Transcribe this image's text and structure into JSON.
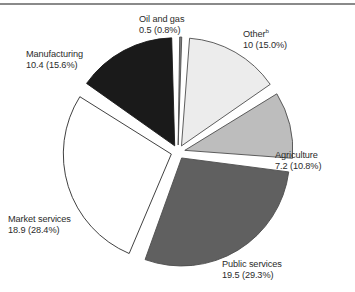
{
  "figure": {
    "name": "pie-chart-figure",
    "rule_color": "#8a8a8a",
    "background": "#ffffff",
    "text_color": "#2b2b2b"
  },
  "chart_data": {
    "type": "pie",
    "title": "",
    "subtitle": "",
    "xlabel": "",
    "ylabel": "",
    "legend_position": "none",
    "grid": false,
    "exploded": true,
    "total": 66.5,
    "units": "",
    "start_angle_deg": 0,
    "direction": "clockwise",
    "categories": [
      "Oil and gas",
      "Other",
      "Agriculture",
      "Public services",
      "Market services",
      "Manufacturing"
    ],
    "values": [
      0.5,
      10,
      7.2,
      19.5,
      18.9,
      10.4
    ],
    "percents": [
      0.8,
      15.0,
      10.8,
      29.3,
      28.4,
      15.6
    ],
    "colors": [
      "#808080",
      "#ececec",
      "#bdbdbd",
      "#606060",
      "#ffffff",
      "#1a1a1a"
    ],
    "slices": [
      {
        "key": "oil-and-gas",
        "name": "Oil and gas",
        "name_sup": "",
        "value": "0.5",
        "percent": "0.8%",
        "value_line": "0.5 (0.8%)",
        "color": "#808080",
        "stroke": "#4d4d4d"
      },
      {
        "key": "other",
        "name": "Other",
        "name_sup": "b",
        "value": "10",
        "percent": "15.0%",
        "value_line": "10 (15.0%)",
        "color": "#ececec",
        "stroke": "#4d4d4d"
      },
      {
        "key": "agriculture",
        "name": "Agriculture",
        "name_sup": "",
        "value": "7.2",
        "percent": "10.8%",
        "value_line": "7.2 (10.8%)",
        "color": "#bdbdbd",
        "stroke": "#4d4d4d"
      },
      {
        "key": "public-services",
        "name": "Public services",
        "name_sup": "",
        "value": "19.5",
        "percent": "29.3%",
        "value_line": "19.5 (29.3%)",
        "color": "#606060",
        "stroke": "#4d4d4d"
      },
      {
        "key": "market-services",
        "name": "Market services",
        "name_sup": "",
        "value": "18.9",
        "percent": "28.4%",
        "value_line": "18.9 (28.4%)",
        "color": "#ffffff",
        "stroke": "#2b2b2b"
      },
      {
        "key": "manufacturing",
        "name": "Manufacturing",
        "name_sup": "",
        "value": "10.4",
        "percent": "15.6%",
        "value_line": "10.4 (15.6%)",
        "color": "#1a1a1a",
        "stroke": "#1a1a1a"
      }
    ]
  }
}
